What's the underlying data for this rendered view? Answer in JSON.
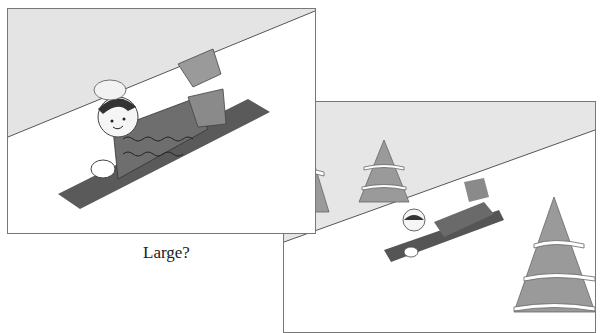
{
  "illustrations": [
    {
      "id": "large",
      "description": "Child in knit hat and wavy-pattern sweater lying on a sled on a snowy slope, close-up view",
      "caption": "Large?"
    },
    {
      "id": "small",
      "description": "Same child on sled drawn smaller on a snowy slope with three snow-covered pine trees"
    }
  ],
  "colors": {
    "sky": "#e4e4e4",
    "snow": "#ffffff",
    "sled": "#5a5a5a",
    "sweater": "#6e6e6e",
    "pants": "#8a8a8a",
    "boot": "#9a9a9a",
    "tree": "#999999",
    "hat": "#f2f2f2"
  }
}
